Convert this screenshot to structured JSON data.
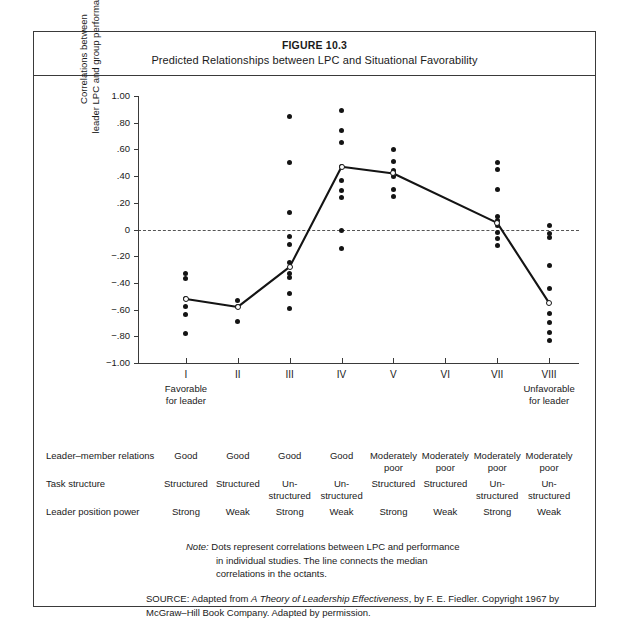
{
  "figure": {
    "number": "FIGURE 10.3",
    "title": "Predicted Relationships between LPC and Situational Favorability"
  },
  "chart_data": {
    "type": "scatter",
    "title": "Predicted Relationships between LPC and Situational Favorability",
    "xlabel": "",
    "ylabel": "Correlations between leader LPC and group performance",
    "ylim": [
      -1.0,
      1.0
    ],
    "xlim": [
      0.5,
      8.5
    ],
    "grid": false,
    "legend": null,
    "y_ticks": [
      1.0,
      0.8,
      0.6,
      0.4,
      0.2,
      0,
      -0.2,
      -0.4,
      -0.6,
      -0.8,
      -1.0
    ],
    "y_tick_labels": [
      "1.00",
      ".80",
      ".60",
      ".40",
      ".20",
      "0",
      "−.20",
      "−.40",
      "−.60",
      "−.80",
      "−1.00"
    ],
    "categories": [
      "I",
      "II",
      "III",
      "IV",
      "V",
      "VI",
      "VII",
      "VIII"
    ],
    "zero_reference_line": 0,
    "series": [
      {
        "name": "Individual study correlations",
        "marker": "filled-dot",
        "points_by_octant": [
          [
            -0.33,
            -0.37,
            -0.52,
            -0.58,
            -0.64,
            -0.78
          ],
          [
            -0.53,
            -0.58,
            -0.69
          ],
          [
            0.85,
            0.5,
            0.13,
            -0.05,
            -0.11,
            -0.25,
            -0.33,
            -0.36,
            -0.48,
            -0.59
          ],
          [
            0.89,
            0.74,
            0.65,
            0.47,
            0.37,
            0.29,
            0.24,
            -0.01,
            -0.14
          ],
          [
            0.6,
            0.51,
            0.44,
            0.42,
            0.4,
            0.3,
            0.25
          ],
          [],
          [
            0.5,
            0.45,
            0.3,
            0.1,
            0.07,
            0.03,
            -0.02,
            -0.07,
            -0.12
          ],
          [
            0.03,
            -0.03,
            -0.06,
            -0.27,
            -0.44,
            -0.63,
            -0.7,
            -0.77,
            -0.83
          ]
        ]
      },
      {
        "name": "Median correlation in octant",
        "marker": "open-dot-with-line",
        "values": [
          -0.52,
          -0.58,
          -0.28,
          0.47,
          0.42,
          null,
          0.05,
          -0.55
        ]
      }
    ]
  },
  "axis": {
    "octant_labels": [
      "I",
      "II",
      "III",
      "IV",
      "V",
      "VI",
      "VII",
      "VIII"
    ],
    "left_endnote": "Favorable\nfor leader",
    "left_endnote_line1": "Favorable",
    "left_endnote_line2": "for leader",
    "right_endnote_line1": "Unfavorable",
    "right_endnote_line2": "for leader",
    "y_title_line1": "Correlations between",
    "y_title_line2": "leader LPC and group performance"
  },
  "condition_table": {
    "rows": [
      {
        "label": "Leader–member relations",
        "cells": [
          "Good",
          "Good",
          "Good",
          "Good",
          "Moderately\npoor",
          "Moderately\npoor",
          "Moderately\npoor",
          "Moderately\npoor"
        ]
      },
      {
        "label": "Task structure",
        "cells": [
          "Structured",
          "Structured",
          "Un-\nstructured",
          "Un-\nstructured",
          "Structured",
          "Structured",
          "Un-\nstructured",
          "Un-\nstructured"
        ]
      },
      {
        "label": "Leader position power",
        "cells": [
          "Strong",
          "Weak",
          "Strong",
          "Weak",
          "Strong",
          "Weak",
          "Strong",
          "Weak"
        ]
      }
    ]
  },
  "note": {
    "word": "Note:",
    "line1": "Dots represent correlations between LPC and performance",
    "line2": "in individual studies. The line connects the median",
    "line3": "correlations in the octants."
  },
  "source": {
    "prefix": "SOURCE:  Adapted from ",
    "italic_title": "A Theory of Leadership Effectiveness",
    "suffix": ", by F. E. Fiedler. Copyright",
    "line2": "1967 by McGraw–Hill Book Company. Adapted by permission."
  },
  "colors": {
    "border": "#3a3a3a",
    "dot": "#141414",
    "zero_line": "#555555",
    "background": "#ffffff"
  }
}
